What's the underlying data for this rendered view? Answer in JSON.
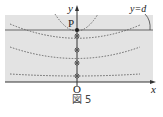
{
  "figure": {
    "caption": "図 5",
    "labels": {
      "y_axis": "y",
      "x_axis": "x",
      "origin": "O",
      "point_p": "P",
      "boundary_line": "y=d"
    },
    "colors": {
      "band_fill": "#e3e3e3",
      "line": "#555555",
      "dotted_curve": "#666666",
      "axis": "#333333"
    },
    "points_on_y_axis": [
      {
        "name": "P",
        "style": "filled"
      },
      {
        "name": "q1",
        "style": "crossed-circle"
      },
      {
        "name": "q2",
        "style": "crossed-circle"
      },
      {
        "name": "q3",
        "style": "crossed-circle"
      },
      {
        "name": "q4",
        "style": "crossed-circle"
      }
    ]
  }
}
